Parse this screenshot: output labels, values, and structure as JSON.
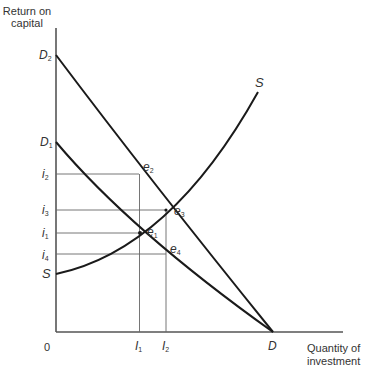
{
  "axes": {
    "y_title_line1": "Return on",
    "y_title_line2": "capital",
    "x_title_line1": "Quantity of",
    "x_title_line2": "investment",
    "origin": "0"
  },
  "y_labels": {
    "D2": {
      "main": "D",
      "sub": "2"
    },
    "D1": {
      "main": "D",
      "sub": "1"
    },
    "i2": {
      "main": "i",
      "sub": "2"
    },
    "i3": {
      "main": "i",
      "sub": "3"
    },
    "i1": {
      "main": "i",
      "sub": "1"
    },
    "i4": {
      "main": "i",
      "sub": "4"
    },
    "S": {
      "main": "S"
    }
  },
  "x_labels": {
    "I1": {
      "main": "I",
      "sub": "1"
    },
    "I2": {
      "main": "I",
      "sub": "2"
    },
    "D": {
      "main": "D"
    }
  },
  "points": {
    "e1": {
      "main": "e",
      "sub": "1"
    },
    "e2": {
      "main": "e",
      "sub": "2"
    },
    "e3": {
      "main": "e",
      "sub": "3"
    },
    "e4": {
      "main": "e",
      "sub": "4"
    }
  },
  "curve_labels": {
    "S_top": "S"
  },
  "colors": {
    "curve": "#1a1a1a",
    "axis": "#444444",
    "guide": "#555555"
  }
}
